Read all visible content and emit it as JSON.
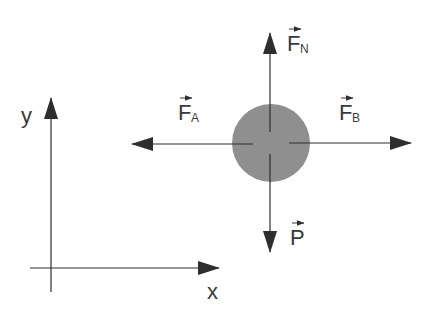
{
  "diagram": {
    "type": "free-body-diagram",
    "colors": {
      "ink": "#2e2e2e",
      "body_fill": "#8f8f8f",
      "background": "#ffffff"
    },
    "axes": {
      "x_label": "x",
      "y_label": "y"
    },
    "body": {
      "shape": "circle"
    },
    "forces": [
      {
        "id": "normal",
        "letter": "F",
        "subscript": "N",
        "direction": "up"
      },
      {
        "id": "left",
        "letter": "F",
        "subscript": "A",
        "direction": "left"
      },
      {
        "id": "right",
        "letter": "F",
        "subscript": "B",
        "direction": "right"
      },
      {
        "id": "weight",
        "letter": "P",
        "subscript": "",
        "direction": "down"
      }
    ],
    "vector_arrow_glyph": "→"
  }
}
